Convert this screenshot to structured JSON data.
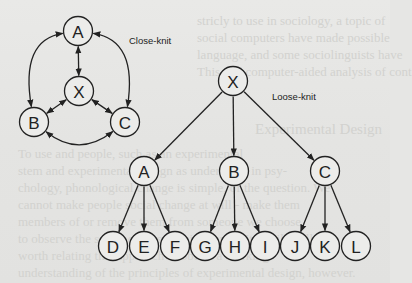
{
  "figure": {
    "close_knit": {
      "label": "Close-knit",
      "nodes": [
        {
          "id": "A",
          "label": "A"
        },
        {
          "id": "X",
          "label": "X"
        },
        {
          "id": "B",
          "label": "B"
        },
        {
          "id": "C",
          "label": "C"
        }
      ],
      "edges": [
        {
          "from": "A",
          "to": "X",
          "type": "bidirectional"
        },
        {
          "from": "A",
          "to": "B",
          "type": "bidirectional",
          "curved": true
        },
        {
          "from": "A",
          "to": "C",
          "type": "bidirectional",
          "curved": true
        },
        {
          "from": "X",
          "to": "B",
          "type": "bidirectional"
        },
        {
          "from": "X",
          "to": "C",
          "type": "bidirectional"
        },
        {
          "from": "B",
          "to": "C",
          "type": "bidirectional",
          "curved": true
        }
      ]
    },
    "loose_knit": {
      "label": "Loose-knit",
      "nodes": [
        {
          "id": "X",
          "label": "X"
        },
        {
          "id": "A",
          "label": "A"
        },
        {
          "id": "B",
          "label": "B"
        },
        {
          "id": "C",
          "label": "C"
        },
        {
          "id": "D",
          "label": "D"
        },
        {
          "id": "E",
          "label": "E"
        },
        {
          "id": "F",
          "label": "F"
        },
        {
          "id": "G",
          "label": "G"
        },
        {
          "id": "H",
          "label": "H"
        },
        {
          "id": "I",
          "label": "I"
        },
        {
          "id": "J",
          "label": "J"
        },
        {
          "id": "K",
          "label": "K"
        },
        {
          "id": "L",
          "label": "L"
        }
      ],
      "edges": [
        {
          "from": "X",
          "to": "A",
          "type": "directed"
        },
        {
          "from": "X",
          "to": "B",
          "type": "directed"
        },
        {
          "from": "X",
          "to": "C",
          "type": "directed"
        },
        {
          "from": "A",
          "to": "D",
          "type": "directed"
        },
        {
          "from": "A",
          "to": "E",
          "type": "directed"
        },
        {
          "from": "A",
          "to": "F",
          "type": "directed"
        },
        {
          "from": "B",
          "to": "G",
          "type": "directed"
        },
        {
          "from": "B",
          "to": "H",
          "type": "directed"
        },
        {
          "from": "B",
          "to": "I",
          "type": "directed"
        },
        {
          "from": "C",
          "to": "J",
          "type": "directed"
        },
        {
          "from": "C",
          "to": "K",
          "type": "directed"
        },
        {
          "from": "C",
          "to": "L",
          "type": "directed"
        }
      ]
    }
  },
  "background_text": {
    "heading": "Experimental Design",
    "lines_top": [
      "stricly to use in sociology, a topic of",
      "social computers have made possible",
      "language, and some sociolinguists have",
      "This and computer-aided analysis of cont"
    ],
    "lines_bottom": [
      "To use and people, such as an experimental",
      "stem and experimental design as understood in psy-",
      "chology, phonological change is simple, of the question. We",
      "cannot make people social change at will - make them",
      "members of or remove them from someone we choose",
      "to observe the social effects of this change. It is still well",
      "worth relating this approach to obtain a working",
      "understanding of the principles of experimental design, however."
    ]
  }
}
